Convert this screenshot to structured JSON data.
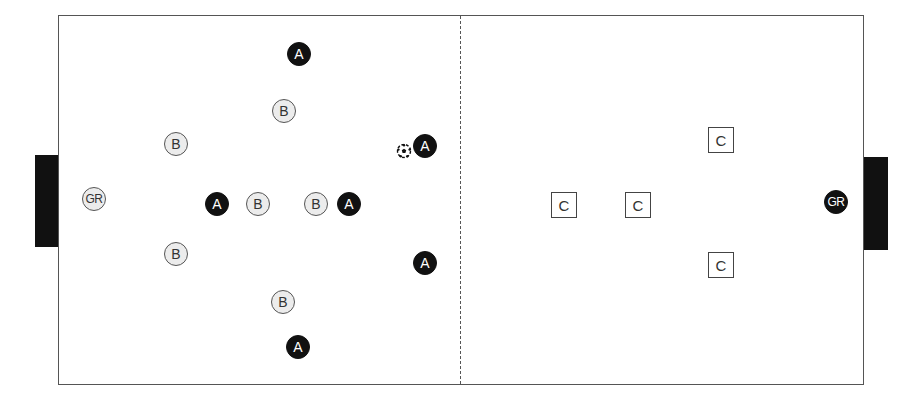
{
  "diagram": {
    "type": "soccer-drill",
    "field": {
      "left": 58,
      "top": 15,
      "width": 806,
      "height": 370,
      "line_color": "#555555"
    },
    "halfway_line": {
      "x": 460,
      "style": "dashed"
    },
    "goals": [
      {
        "side": "left",
        "x": 35,
        "y": 155,
        "width": 23,
        "height": 92,
        "color": "#111111"
      },
      {
        "side": "right",
        "x": 864,
        "y": 157,
        "width": 24,
        "height": 93,
        "color": "#111111"
      }
    ],
    "players": [
      {
        "label": "A",
        "team": "A",
        "style": "dark",
        "x": 299,
        "y": 54
      },
      {
        "label": "B",
        "team": "B",
        "style": "light",
        "x": 284,
        "y": 111
      },
      {
        "label": "B",
        "team": "B",
        "style": "light",
        "x": 176,
        "y": 144
      },
      {
        "label": "A",
        "team": "A",
        "style": "dark",
        "x": 425,
        "y": 146
      },
      {
        "label": "GR",
        "team": "B",
        "style": "light",
        "x": 94,
        "y": 199
      },
      {
        "label": "A",
        "team": "A",
        "style": "dark",
        "x": 217,
        "y": 204
      },
      {
        "label": "B",
        "team": "B",
        "style": "light",
        "x": 258,
        "y": 204
      },
      {
        "label": "B",
        "team": "B",
        "style": "light",
        "x": 316,
        "y": 204
      },
      {
        "label": "A",
        "team": "A",
        "style": "dark",
        "x": 349,
        "y": 204
      },
      {
        "label": "B",
        "team": "B",
        "style": "light",
        "x": 176,
        "y": 254
      },
      {
        "label": "A",
        "team": "A",
        "style": "dark",
        "x": 425,
        "y": 263
      },
      {
        "label": "B",
        "team": "B",
        "style": "light",
        "x": 283,
        "y": 302
      },
      {
        "label": "A",
        "team": "A",
        "style": "dark",
        "x": 298,
        "y": 347
      },
      {
        "label": "GR",
        "team": "A",
        "style": "dark",
        "x": 836,
        "y": 202
      }
    ],
    "cones": [
      {
        "label": "C",
        "x": 721,
        "y": 140
      },
      {
        "label": "C",
        "x": 564,
        "y": 205
      },
      {
        "label": "C",
        "x": 638,
        "y": 205
      },
      {
        "label": "C",
        "x": 721,
        "y": 265
      }
    ],
    "ball": {
      "x": 404,
      "y": 151
    }
  }
}
